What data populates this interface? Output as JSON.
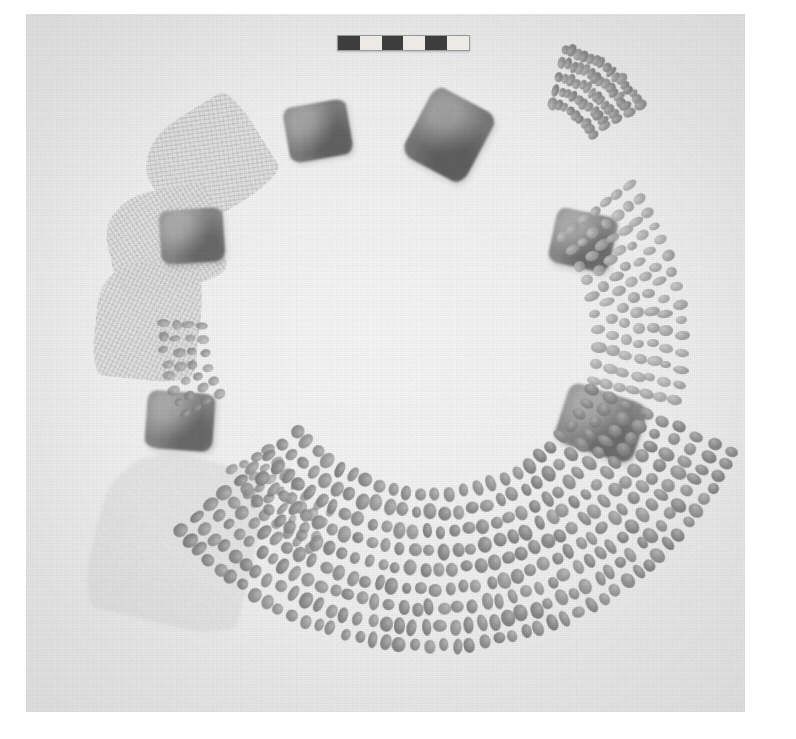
{
  "image": {
    "kind": "archaeological-field-photograph",
    "subject": "Ring-shaped arrangement of excavated artifacts",
    "caption": "Circular arrangement of woven matting fragments, rectangular stone blocks and concentric strands of beads, with photographic scale bar at top",
    "plate": {
      "background_color": "#f2f2f2",
      "border_color": "#ffffff",
      "left": 26,
      "top": 14,
      "width": 719,
      "height": 698
    }
  },
  "scale_bar": {
    "name": "photographic-scale-bar",
    "left": 337,
    "top": 35,
    "width": 131,
    "height": 14,
    "segment_count": 6,
    "segments": [
      "dark",
      "light",
      "dark",
      "light",
      "dark",
      "light"
    ],
    "dark_color": "#3d3d3d",
    "light_color": "#eceae4"
  },
  "artifacts": {
    "fans": [
      {
        "name": "woven-mat-fragment-upper-left",
        "left": 148,
        "top": 110,
        "width": 118,
        "height": 104,
        "rotate": -32,
        "weave_angle": 24,
        "faint": false
      },
      {
        "name": "woven-mat-fragment-left-upper",
        "left": 108,
        "top": 190,
        "width": 112,
        "height": 100,
        "rotate": -12,
        "weave_angle": 70,
        "faint": false
      },
      {
        "name": "woven-mat-fragment-left-mid",
        "left": 96,
        "top": 262,
        "width": 104,
        "height": 118,
        "rotate": 6,
        "weave_angle": 110,
        "faint": false
      },
      {
        "name": "woven-mat-fragment-lower-left",
        "left": 96,
        "top": 455,
        "width": 160,
        "height": 170,
        "rotate": 14,
        "weave_angle": 140,
        "faint": true
      }
    ],
    "blocks": [
      {
        "name": "stone-block-top",
        "left": 286,
        "top": 103,
        "width": 64,
        "height": 56,
        "rotate": -10,
        "tone": "#7d7d7d"
      },
      {
        "name": "stone-block-upper-left",
        "left": 160,
        "top": 209,
        "width": 64,
        "height": 54,
        "rotate": -4,
        "tone": "#878787"
      },
      {
        "name": "stone-block-left",
        "left": 146,
        "top": 392,
        "width": 68,
        "height": 58,
        "rotate": 4,
        "tone": "#868686"
      },
      {
        "name": "stone-block-top-right",
        "left": 414,
        "top": 96,
        "width": 70,
        "height": 78,
        "rotate": 28,
        "tone": "#787878"
      },
      {
        "name": "stone-block-right-mid",
        "left": 552,
        "top": 212,
        "width": 62,
        "height": 56,
        "rotate": 12,
        "tone": "#8a8a8a"
      },
      {
        "name": "stone-block-right-low",
        "left": 560,
        "top": 392,
        "width": 82,
        "height": 62,
        "rotate": 18,
        "tone": "#8b8b8b"
      }
    ],
    "bead_clusters": [
      {
        "name": "bead-cluster-upper-right",
        "cx": 536,
        "cy": 170,
        "r_start": 68,
        "r_step": 14,
        "rows": 5,
        "a_start": -76,
        "a_end": -32,
        "per_row": 9,
        "bead_w": 11,
        "bead_h": 8,
        "tone": "normal"
      },
      {
        "name": "bead-cluster-right",
        "cx": 430,
        "cy": 340,
        "r_start": 168,
        "r_step": 14,
        "rows": 7,
        "a_start": -38,
        "a_end": 14,
        "per_row": 10,
        "bead_w": 13,
        "bead_h": 9,
        "tone": "pale"
      },
      {
        "name": "bead-cluster-left-small",
        "cx": 330,
        "cy": 330,
        "r_start": 128,
        "r_step": 13,
        "rows": 4,
        "a_start": 150,
        "a_end": 182,
        "per_row": 6,
        "bead_w": 11,
        "bead_h": 8,
        "tone": "dim"
      },
      {
        "name": "bead-cluster-lower-left",
        "cx": 400,
        "cy": 380,
        "r_start": 148,
        "r_step": 14,
        "rows": 4,
        "a_start": 118,
        "a_end": 152,
        "per_row": 7,
        "bead_w": 12,
        "bead_h": 9,
        "tone": "dim"
      },
      {
        "name": "bead-cluster-bottom-arc",
        "cx": 432,
        "cy": 318,
        "r_start": 176,
        "r_step": 19,
        "rows": 9,
        "a_start": 24,
        "a_end": 140,
        "per_row": 26,
        "bead_w": 14,
        "bead_h": 11,
        "tone": "normal"
      }
    ]
  },
  "colors": {
    "paper_white": "#ffffff",
    "plate_ground": "#f2f2f2",
    "artifact_dark": "#7a7a7a",
    "artifact_mid": "#9a9a9a",
    "artifact_pale": "#d8d8d8"
  }
}
